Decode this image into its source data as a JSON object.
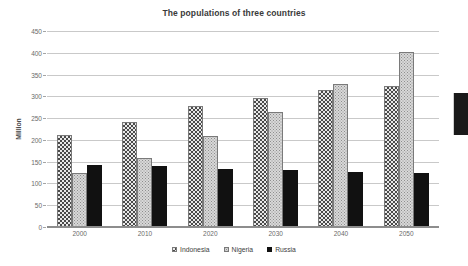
{
  "chart_data": {
    "type": "bar",
    "title": "The populations of three countries",
    "xlabel": "",
    "ylabel": "Million",
    "categories": [
      "2000",
      "2010",
      "2020",
      "2030",
      "2040",
      "2050"
    ],
    "series": [
      {
        "name": "Indonesia",
        "values": [
          211,
          241,
          278,
          297,
          314,
          323
        ],
        "pattern": "dense-checker-speckle",
        "color": "#4a4a4a"
      },
      {
        "name": "Nigeria",
        "values": [
          124,
          159,
          208,
          265,
          329,
          401
        ],
        "pattern": "fine-light-dots",
        "color": "#d8d8d8"
      },
      {
        "name": "Russia",
        "values": [
          143,
          140,
          134,
          130,
          126,
          123
        ],
        "pattern": "solid",
        "color": "#111111"
      }
    ],
    "ylim": [
      0,
      450
    ],
    "yticks": [
      0,
      50,
      100,
      150,
      200,
      250,
      300,
      350,
      400,
      450
    ],
    "ytick_labels": [
      "0",
      "50",
      "100",
      "150",
      "200",
      "250",
      "300",
      "350",
      "400",
      "450"
    ],
    "grid": true,
    "legend_position": "bottom"
  }
}
